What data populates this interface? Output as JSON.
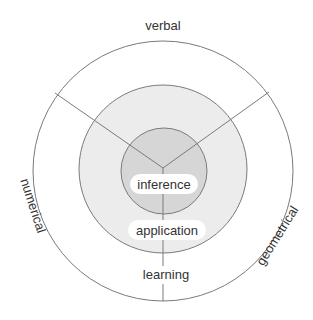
{
  "diagram": {
    "type": "concentric-circles",
    "center": {
      "x": 163,
      "y": 171
    },
    "colors": {
      "background": "#ffffff",
      "outer_fill": "#ffffff",
      "middle_fill": "#ececec",
      "inner_fill": "#d6d6d6",
      "stroke": "#7a7a7a",
      "pill_fill": "#ffffff",
      "text": "#333333"
    },
    "rings": [
      {
        "name": "outer",
        "radius": 130,
        "label": "learning"
      },
      {
        "name": "middle",
        "radius": 84,
        "label": "application"
      },
      {
        "name": "inner",
        "radius": 43,
        "label": "inference"
      }
    ],
    "sectors": [
      {
        "label": "verbal",
        "position": "top"
      },
      {
        "label": "numerical",
        "position": "left"
      },
      {
        "label": "geometrical",
        "position": "right"
      }
    ],
    "labels": {
      "verbal": "verbal",
      "numerical": "numerical",
      "geometrical": "geometrical",
      "inference": "inference",
      "application": "application",
      "learning": "learning"
    }
  }
}
